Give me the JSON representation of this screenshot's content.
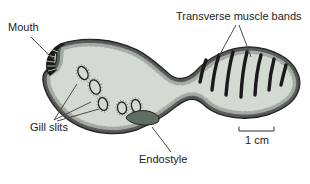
{
  "labels": {
    "mouth": "Mouth",
    "transverse_muscle_bands": "Transverse muscle bands",
    "gill_slits": "Gill slits",
    "endostyle": "Endostyle"
  },
  "scale_bar": {
    "label": "1 cm"
  },
  "anatomy": {
    "gill_slit_count": 5,
    "muscle_band_count": 7
  },
  "colors": {
    "background": "#ffffff",
    "body_fill": "#d2dad2",
    "outline": "#1f1f1f",
    "stipple": "#3a3a3a",
    "muscle_band": "#1a1a1a",
    "mouth_fill": "#1a1a1a",
    "mouth_ridge": "#c9d3c9",
    "endostyle_fill": "#5f6d62",
    "leader_line": "#4a4a4a",
    "text": "#1b1b1b",
    "scale_bar": "#333333"
  }
}
